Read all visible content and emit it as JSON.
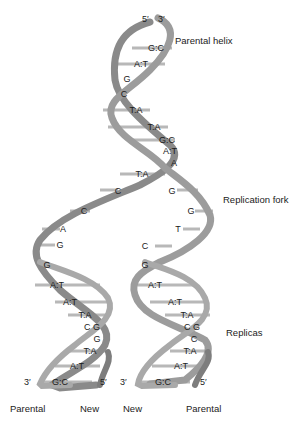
{
  "diagram": {
    "labels": {
      "parental_helix": "Parental helix",
      "replication_fork": "Replication fork",
      "replicas": "Replicas"
    },
    "top_ends": {
      "left": "5′",
      "right": "3′"
    },
    "parental_helix_pairs": [
      "G:C",
      "A:T",
      "G",
      "C",
      "T:A",
      "T:A",
      "G:C",
      "A:T",
      "A",
      "T:A"
    ],
    "fork_left_bases": [
      "C",
      "C",
      "A",
      "G",
      "G"
    ],
    "fork_right_bases": [
      "G",
      "G",
      "T",
      "C",
      "G"
    ],
    "left_replica": {
      "pairs": [
        "A:T",
        "A:T",
        "T:A",
        "C G",
        "G",
        "T:A",
        "A:T",
        "G:C"
      ],
      "ends": {
        "left": "3′",
        "right": "5′"
      }
    },
    "right_replica": {
      "pairs": [
        "A:T",
        "A:T",
        "T:A",
        "C G",
        "C",
        "T:A",
        "A:T",
        "G:C"
      ],
      "ends": {
        "left": "3′",
        "right": "5′"
      }
    },
    "strand_labels": [
      "Parental",
      "New",
      "New",
      "Parental"
    ],
    "colors": {
      "ribbon_dark": "#6e6e6e",
      "ribbon_mid": "#9a9a9a",
      "ribbon_light": "#c8c8c8",
      "rung": "#b5b5b5",
      "text": "#1a1a1a"
    }
  }
}
